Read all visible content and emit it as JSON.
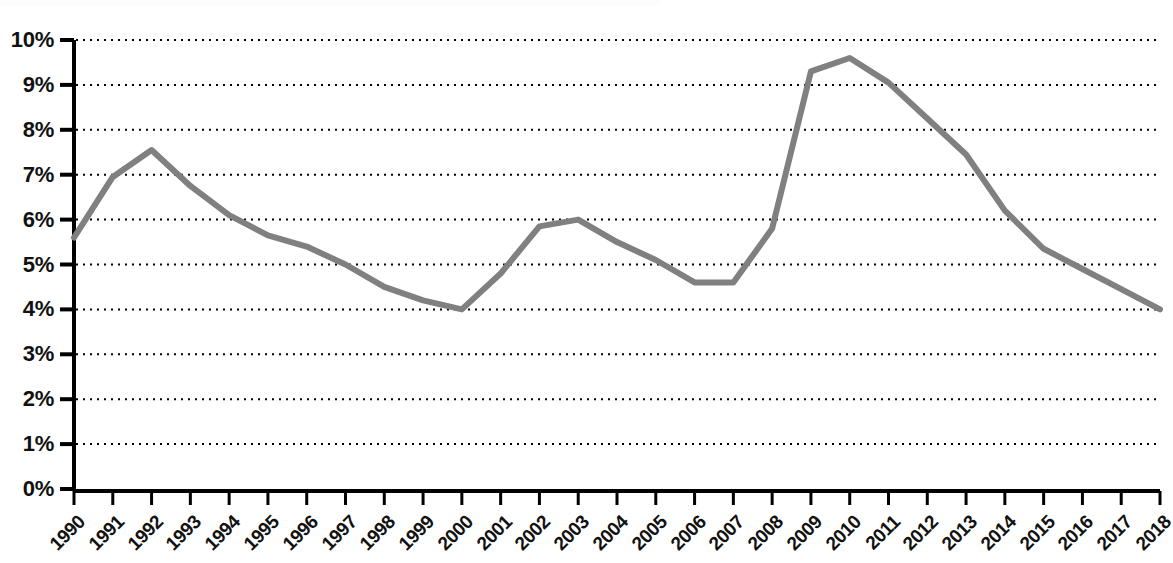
{
  "chart_data": {
    "type": "line",
    "title": "",
    "subtitle": "",
    "xlabel": "",
    "ylabel": "",
    "categories": [
      "1990",
      "1991",
      "1992",
      "1993",
      "1994",
      "1995",
      "1996",
      "1997",
      "1998",
      "1999",
      "2000",
      "2001",
      "2002",
      "2003",
      "2004",
      "2005",
      "2006",
      "2007",
      "2008",
      "2009",
      "2010",
      "2011",
      "2012",
      "2013",
      "2014",
      "2015",
      "2016",
      "2017",
      "2018"
    ],
    "values": [
      5.6,
      6.95,
      7.55,
      6.75,
      6.1,
      5.65,
      5.4,
      5.0,
      4.5,
      4.2,
      4.0,
      4.8,
      5.85,
      6.0,
      5.5,
      5.1,
      4.6,
      4.6,
      5.8,
      9.3,
      9.6,
      9.05,
      8.25,
      7.45,
      6.2,
      5.35,
      4.9,
      4.45,
      4.0
    ],
    "series": [
      {
        "name": "",
        "values": [
          5.6,
          6.95,
          7.55,
          6.75,
          6.1,
          5.65,
          5.4,
          5.0,
          4.5,
          4.2,
          4.0,
          4.8,
          5.85,
          6.0,
          5.5,
          5.1,
          4.6,
          4.6,
          5.8,
          9.3,
          9.6,
          9.05,
          8.25,
          7.45,
          6.2,
          5.35,
          4.9,
          4.45,
          4.0
        ],
        "color": "#808080"
      }
    ],
    "ylim": [
      0,
      10
    ],
    "yticks": [
      0,
      1,
      2,
      3,
      4,
      5,
      6,
      7,
      8,
      9,
      10
    ],
    "ytick_labels": [
      "0%",
      "1%",
      "2%",
      "3%",
      "4%",
      "5%",
      "6%",
      "7%",
      "8%",
      "9%",
      "10%"
    ],
    "grid": true,
    "grid_axis": "y",
    "grid_style": "dotted",
    "grid_color": "#000000",
    "legend": false,
    "legend_position": "none",
    "axis_color": "#000000",
    "background_color": "#ffffff",
    "line_color": "#808080",
    "line_width": 6,
    "xtick_rotation": -45,
    "annotations": []
  }
}
